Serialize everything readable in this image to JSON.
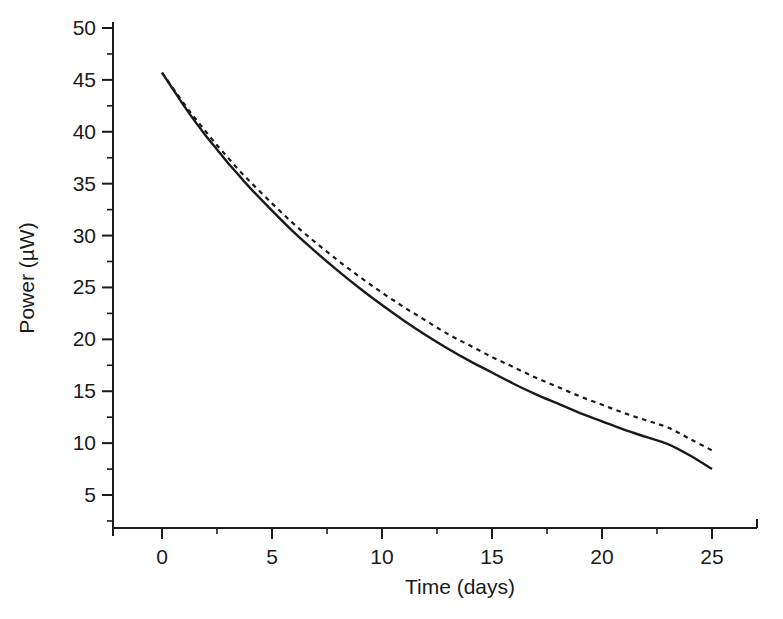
{
  "chart_data": {
    "type": "line",
    "title": "",
    "xlabel": "Time (days)",
    "ylabel": "Power (µW)",
    "xlim": [
      -1.5,
      27.0
    ],
    "ylim": [
      2.8,
      51.5
    ],
    "xticks": [
      0,
      5,
      10,
      15,
      20,
      25
    ],
    "xtick_labels": [
      "0",
      "5",
      "10",
      "15",
      "20",
      "25"
    ],
    "xminor_step": 2.5,
    "yticks": [
      5,
      10,
      15,
      20,
      25,
      30,
      35,
      40,
      45,
      50
    ],
    "ytick_labels": [
      "5",
      "10",
      "15",
      "20",
      "25",
      "30",
      "35",
      "40",
      "45",
      "50"
    ],
    "yminor_step": 2.5,
    "grid": false,
    "legend": "none",
    "axis_color": "#1a1a1a",
    "series": [
      {
        "name": "solid-curve",
        "style": "solid",
        "color": "#1a1a1a",
        "x": [
          0,
          0.5,
          1,
          1.5,
          2,
          2.5,
          3,
          3.5,
          4,
          5,
          6,
          7,
          8,
          9,
          10,
          11,
          12,
          13,
          14,
          15,
          16,
          17,
          18,
          19,
          20,
          21,
          22,
          23,
          24,
          25
        ],
        "y": [
          45.7,
          44.1,
          42.5,
          41.0,
          39.6,
          38.3,
          37.0,
          35.8,
          34.6,
          32.4,
          30.3,
          28.4,
          26.6,
          24.9,
          23.3,
          21.8,
          20.4,
          19.1,
          17.9,
          16.8,
          15.7,
          14.7,
          13.8,
          12.9,
          12.1,
          11.3,
          10.6,
          9.9,
          8.8,
          7.5
        ]
      },
      {
        "name": "dashed-curve",
        "style": "dashed",
        "color": "#1a1a1a",
        "x": [
          0,
          0.5,
          1,
          1.5,
          2,
          2.5,
          3,
          3.5,
          4,
          5,
          6,
          7,
          8,
          9,
          10,
          11,
          12,
          13,
          14,
          15,
          16,
          17,
          18,
          19,
          20,
          21,
          22,
          23,
          24,
          25
        ],
        "y": [
          45.7,
          44.2,
          42.7,
          41.3,
          40.0,
          38.7,
          37.5,
          36.3,
          35.2,
          33.1,
          31.1,
          29.3,
          27.6,
          26.0,
          24.5,
          23.1,
          21.8,
          20.5,
          19.4,
          18.3,
          17.3,
          16.3,
          15.4,
          14.5,
          13.7,
          12.9,
          12.2,
          11.5,
          10.4,
          9.3
        ]
      }
    ]
  },
  "figure": {
    "background_color": "#ffffff",
    "plot_left_px": 113,
    "plot_bottom_px": 528
  }
}
